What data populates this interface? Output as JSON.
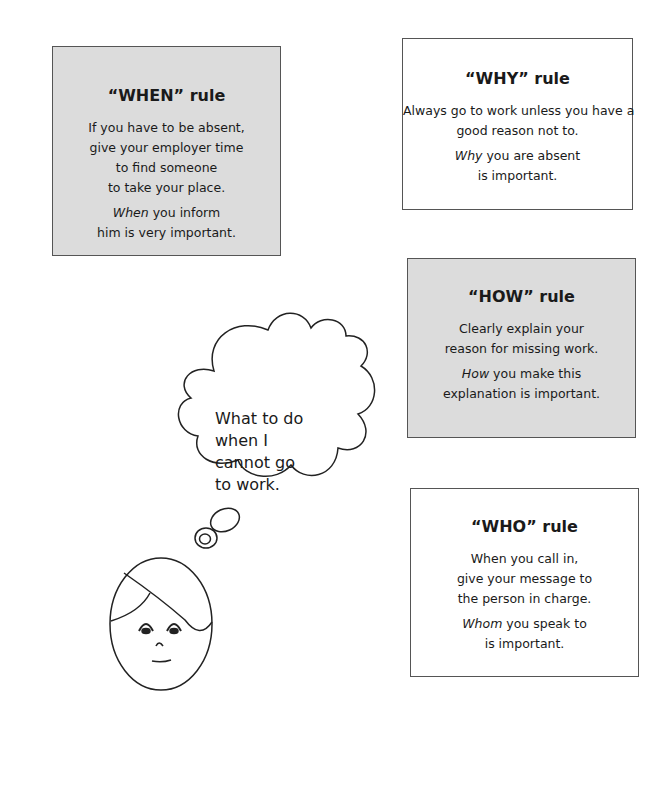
{
  "rules": [
    {
      "id": "when",
      "title": "“WHEN” rule",
      "shaded": true,
      "body_lines": [
        "If you have to be absent,",
        "give your employer time",
        "to find someone",
        "to take your place."
      ],
      "emphasis_word": "When",
      "emphasis_lines": [
        " you inform",
        "him is very important."
      ]
    },
    {
      "id": "why",
      "title": "“WHY” rule",
      "shaded": false,
      "body_lines": [
        "Always go to work unless you have a",
        "good reason not to."
      ],
      "emphasis_word": "Why",
      "emphasis_lines": [
        " you are absent",
        "is important."
      ]
    },
    {
      "id": "how",
      "title": "“HOW” rule",
      "shaded": true,
      "body_lines": [
        "Clearly explain your",
        "reason for missing work."
      ],
      "emphasis_word": "How",
      "emphasis_lines": [
        " you make this",
        "explanation is important."
      ]
    },
    {
      "id": "who",
      "title": "“WHO” rule",
      "shaded": false,
      "body_lines": [
        "When you call in,",
        "give your message to",
        "the person in charge."
      ],
      "emphasis_word": "Whom",
      "emphasis_lines": [
        " you speak to",
        "is important."
      ]
    }
  ],
  "thought_bubble": {
    "lines": [
      "What to do",
      "when I",
      "cannot go",
      "to work."
    ]
  },
  "illustration": {
    "figure": "person-face-icon",
    "bubble": "thought-cloud-icon"
  },
  "colors": {
    "shaded_box": "#dcdcdc",
    "border": "#555555",
    "ink": "#1a1a1a"
  }
}
